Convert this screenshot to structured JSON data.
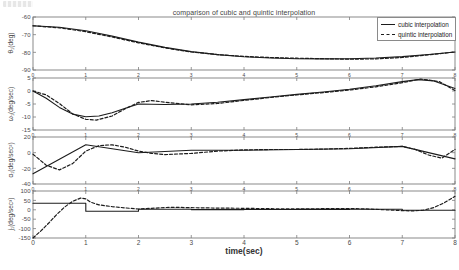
{
  "title": "comparison of cubic and quintic interpolation",
  "xlabel": "time(sec)",
  "legend": {
    "items": [
      {
        "label": "cubic interpolation",
        "style": "solid"
      },
      {
        "label": "quintic interpolation",
        "style": "dashed"
      }
    ]
  },
  "colors": {
    "line": "#1c1c1c",
    "axis": "#7d7d7d",
    "tick_text": "#4a4a4a",
    "background": "#ffffff"
  },
  "chart_data": [
    {
      "type": "line",
      "ylabel": "θ₁(deg)",
      "xlim": [
        0,
        8
      ],
      "ylim": [
        -90,
        -60
      ],
      "xticks": [
        0,
        1,
        2,
        3,
        4,
        5,
        6,
        7,
        8
      ],
      "yticks": [
        -60,
        -70,
        -80,
        -90
      ],
      "series": [
        {
          "name": "cubic interpolation",
          "style": "solid",
          "points": [
            [
              0,
              -65
            ],
            [
              0.5,
              -65.8
            ],
            [
              1,
              -67.8
            ],
            [
              1.5,
              -70.8
            ],
            [
              2,
              -74.2
            ],
            [
              2.5,
              -77.2
            ],
            [
              3,
              -79.6
            ],
            [
              3.5,
              -81.3
            ],
            [
              4,
              -82.5
            ],
            [
              4.5,
              -83.2
            ],
            [
              5,
              -83.6
            ],
            [
              5.5,
              -83.7
            ],
            [
              6,
              -83.6
            ],
            [
              6.5,
              -83.2
            ],
            [
              7,
              -82.4
            ],
            [
              7.5,
              -81.2
            ],
            [
              8,
              -79.8
            ]
          ]
        },
        {
          "name": "quintic interpolation",
          "style": "dashed",
          "points": [
            [
              0,
              -65
            ],
            [
              0.5,
              -66.1
            ],
            [
              1,
              -68.3
            ],
            [
              1.5,
              -71.3
            ],
            [
              2,
              -74.6
            ],
            [
              2.5,
              -77.5
            ],
            [
              3,
              -79.8
            ],
            [
              3.5,
              -81.3
            ],
            [
              4,
              -82.3
            ],
            [
              4.5,
              -82.9
            ],
            [
              5,
              -83.3
            ],
            [
              5.5,
              -83.6
            ],
            [
              6,
              -83.9
            ],
            [
              6.5,
              -83.7
            ],
            [
              7,
              -82.9
            ],
            [
              7.5,
              -81.4
            ],
            [
              8,
              -79.8
            ]
          ]
        }
      ]
    },
    {
      "type": "line",
      "ylabel": "ω₁(deg/sec)",
      "xlim": [
        0,
        8
      ],
      "ylim": [
        -15,
        5
      ],
      "xticks": [
        0,
        1,
        2,
        3,
        4,
        5,
        6,
        7,
        8
      ],
      "yticks": [
        5,
        0,
        -5,
        -10,
        -15
      ],
      "series": [
        {
          "name": "cubic interpolation",
          "style": "solid",
          "points": [
            [
              0,
              0
            ],
            [
              0.25,
              -2.8
            ],
            [
              0.5,
              -6.3
            ],
            [
              0.75,
              -8.9
            ],
            [
              1,
              -9.9
            ],
            [
              1.25,
              -9.6
            ],
            [
              1.5,
              -8.4
            ],
            [
              1.75,
              -6.6
            ],
            [
              2,
              -5.0
            ],
            [
              2.5,
              -5.2
            ],
            [
              3,
              -5.0
            ],
            [
              3.5,
              -4.3
            ],
            [
              4,
              -3.3
            ],
            [
              4.5,
              -2.3
            ],
            [
              5,
              -1.3
            ],
            [
              5.5,
              -0.4
            ],
            [
              6,
              0.7
            ],
            [
              6.5,
              2.0
            ],
            [
              7,
              3.6
            ],
            [
              7.3,
              4.4
            ],
            [
              7.6,
              3.9
            ],
            [
              8,
              1.0
            ]
          ]
        },
        {
          "name": "quintic interpolation",
          "style": "dashed",
          "points": [
            [
              0,
              0
            ],
            [
              0.25,
              -1.5
            ],
            [
              0.5,
              -4.8
            ],
            [
              0.75,
              -8.8
            ],
            [
              1,
              -10.9
            ],
            [
              1.2,
              -11.2
            ],
            [
              1.5,
              -9.6
            ],
            [
              1.75,
              -6.8
            ],
            [
              2,
              -4.4
            ],
            [
              2.25,
              -3.7
            ],
            [
              2.5,
              -4.3
            ],
            [
              3,
              -5.3
            ],
            [
              3.5,
              -4.8
            ],
            [
              4,
              -3.6
            ],
            [
              4.5,
              -2.5
            ],
            [
              5,
              -1.5
            ],
            [
              5.5,
              -0.6
            ],
            [
              6,
              0.4
            ],
            [
              6.5,
              1.6
            ],
            [
              7,
              3.2
            ],
            [
              7.35,
              4.6
            ],
            [
              7.7,
              3.6
            ],
            [
              8,
              0.2
            ]
          ]
        }
      ]
    },
    {
      "type": "line",
      "ylabel": "α₁(deg/sec²)",
      "xlim": [
        0,
        8
      ],
      "ylim": [
        -40,
        20
      ],
      "xticks": [
        0,
        1,
        2,
        3,
        4,
        5,
        6,
        7,
        8
      ],
      "yticks": [
        20,
        0,
        -20,
        -40
      ],
      "series": [
        {
          "name": "cubic interpolation",
          "style": "solid",
          "points": [
            [
              0,
              -27
            ],
            [
              1,
              10
            ],
            [
              2,
              0
            ],
            [
              3,
              3
            ],
            [
              4,
              3
            ],
            [
              5,
              4
            ],
            [
              6,
              5
            ],
            [
              7,
              8
            ],
            [
              8,
              -8
            ]
          ]
        },
        {
          "name": "quintic interpolation",
          "style": "dashed",
          "points": [
            [
              0,
              -2
            ],
            [
              0.25,
              -16
            ],
            [
              0.5,
              -22
            ],
            [
              0.75,
              -14
            ],
            [
              1,
              2
            ],
            [
              1.25,
              9
            ],
            [
              1.5,
              10
            ],
            [
              1.75,
              7
            ],
            [
              2,
              2
            ],
            [
              2.25,
              -1
            ],
            [
              2.5,
              -2.5
            ],
            [
              3,
              -1
            ],
            [
              3.5,
              2
            ],
            [
              4,
              3.5
            ],
            [
              4.5,
              4
            ],
            [
              5,
              4
            ],
            [
              5.5,
              4.5
            ],
            [
              6,
              5.5
            ],
            [
              6.5,
              7
            ],
            [
              7,
              8
            ],
            [
              7.25,
              4
            ],
            [
              7.5,
              -3
            ],
            [
              7.75,
              -7
            ],
            [
              8,
              4
            ]
          ]
        }
      ]
    },
    {
      "type": "line",
      "ylabel": "j₁(deg/sec³)",
      "xlim": [
        0,
        8
      ],
      "ylim": [
        -150,
        100
      ],
      "xticks": [
        0,
        1,
        2,
        3,
        4,
        5,
        6,
        7,
        8
      ],
      "yticks": [
        100,
        50,
        0,
        -50,
        -100,
        -150
      ],
      "series": [
        {
          "name": "cubic interpolation",
          "style": "solid",
          "points": [
            [
              0,
              35
            ],
            [
              1,
              35
            ],
            [
              1,
              -8
            ],
            [
              2,
              -8
            ],
            [
              2,
              3
            ],
            [
              3,
              3
            ],
            [
              3,
              1
            ],
            [
              4,
              1
            ],
            [
              4,
              1.5
            ],
            [
              5,
              1.5
            ],
            [
              5,
              2
            ],
            [
              6,
              2
            ],
            [
              6,
              2.5
            ],
            [
              7,
              2.5
            ],
            [
              7,
              -2
            ],
            [
              8,
              -2
            ]
          ]
        },
        {
          "name": "quintic interpolation",
          "style": "dashed",
          "points": [
            [
              0,
              -150
            ],
            [
              0.15,
              -112
            ],
            [
              0.3,
              -70
            ],
            [
              0.45,
              -25
            ],
            [
              0.6,
              15
            ],
            [
              0.75,
              45
            ],
            [
              0.9,
              62
            ],
            [
              1,
              58
            ],
            [
              1.1,
              40
            ],
            [
              1.25,
              26
            ],
            [
              1.5,
              17
            ],
            [
              1.75,
              10
            ],
            [
              2,
              4
            ],
            [
              2.25,
              8
            ],
            [
              2.5,
              12
            ],
            [
              2.75,
              13
            ],
            [
              3,
              11
            ],
            [
              3.5,
              9
            ],
            [
              4,
              8
            ],
            [
              4.5,
              6
            ],
            [
              5,
              5
            ],
            [
              5.5,
              6
            ],
            [
              6,
              7
            ],
            [
              6.3,
              5
            ],
            [
              6.6,
              1
            ],
            [
              7,
              -4
            ],
            [
              7.2,
              -6
            ],
            [
              7.4,
              -2
            ],
            [
              7.6,
              12
            ],
            [
              7.8,
              38
            ],
            [
              8,
              72
            ]
          ]
        }
      ]
    }
  ]
}
